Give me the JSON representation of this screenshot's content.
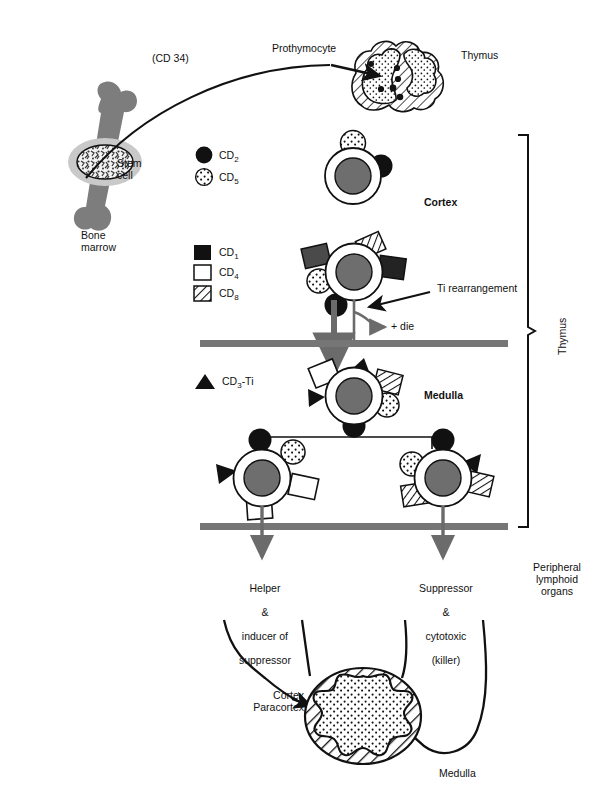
{
  "figure": {
    "colors": {
      "ink": "#111111",
      "bone_gray": "#7d7d7d",
      "nucleus_gray": "#6e6e6e",
      "barrier_gray": "#767676",
      "arrow_gray": "#6b6b6b",
      "marrow_light": "#c9c9c9",
      "white": "#ffffff"
    }
  },
  "labels": {
    "cd34": "(CD 34)",
    "prothymocyte": "Prothymocyte",
    "thymus_organ": "Thymus",
    "stem_cell": "Stem\ncell",
    "bone_marrow": "Bone\nmarrow",
    "cortex": "Cortex",
    "medulla": "Medulla",
    "ti_rearrangement": "Ti rearrangement",
    "die": "+ die",
    "thymus_bracket": "Thymus",
    "peripheral": "Peripheral\nlymphoid\norgans",
    "helper_line1": "Helper",
    "helper_line2": "&",
    "helper_line3": "inducer of",
    "helper_line4": "suppressor",
    "suppressor_line1": "Suppressor",
    "suppressor_line2": "&",
    "suppressor_line3": "cytotoxic",
    "suppressor_line4": "(killer)",
    "node_cortex": "Cortex\nParacortex",
    "node_medulla": "Medulla"
  },
  "legend": {
    "group1": [
      {
        "symbol": "filled-circle",
        "label": "CD",
        "sub": "2"
      },
      {
        "symbol": "stippled-circle",
        "label": "CD",
        "sub": "5"
      }
    ],
    "group2": [
      {
        "symbol": "filled-square",
        "label": "CD",
        "sub": "1"
      },
      {
        "symbol": "open-square",
        "label": "CD",
        "sub": "4"
      },
      {
        "symbol": "hatched-square",
        "label": "CD",
        "sub": "8"
      }
    ],
    "group3": [
      {
        "symbol": "filled-triangle",
        "label": "CD",
        "sub": "3",
        "suffix": "-Ti"
      }
    ]
  },
  "cells": [
    {
      "name": "cortex-early-thymocyte",
      "stage": "Cortex",
      "markers": [
        "CD5",
        "CD2"
      ]
    },
    {
      "name": "cortex-double-positive-thymocyte",
      "stage": "Cortex",
      "markers": [
        "CD1",
        "CD1",
        "CD8",
        "CD5",
        "CD2"
      ]
    },
    {
      "name": "medulla-thymocyte",
      "stage": "Medulla",
      "markers": [
        "CD4",
        "CD8",
        "CD3-Ti",
        "CD3-Ti",
        "CD5",
        "CD2"
      ]
    },
    {
      "name": "helper-t-cell",
      "stage": "Medulla",
      "markers": [
        "CD4",
        "CD4",
        "CD3-Ti",
        "CD5",
        "CD2"
      ]
    },
    {
      "name": "suppressor-t-cell",
      "stage": "Medulla",
      "markers": [
        "CD8",
        "CD8",
        "CD3-Ti",
        "CD5",
        "CD2"
      ]
    }
  ]
}
